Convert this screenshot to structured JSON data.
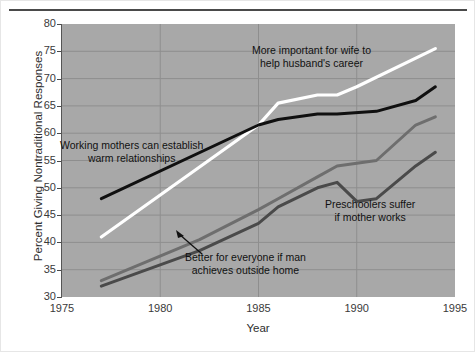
{
  "figure": {
    "background": "#ffffff",
    "plot_background": "#a8a8a8",
    "axis_title_x": "Year",
    "axis_title_y": "Percent Giving Nontraditional Responses"
  },
  "chart_data": {
    "type": "line",
    "title": "",
    "subtitle": "",
    "xlabel": "Year",
    "ylabel": "Percent Giving Nontraditional Responses",
    "xlim": [
      1975,
      1995
    ],
    "ylim": [
      30,
      80
    ],
    "xticks": [
      1975,
      1980,
      1985,
      1990,
      1995
    ],
    "xtick_labels": [
      "1975",
      "1980",
      "1985",
      "1990",
      "1995"
    ],
    "yticks": [
      30,
      35,
      40,
      45,
      50,
      55,
      60,
      65,
      70,
      75,
      80
    ],
    "ytick_labels": [
      "30",
      "35",
      "40",
      "45",
      "50",
      "55",
      "60",
      "65",
      "70",
      "75",
      "80"
    ],
    "grid": true,
    "grid_color": "#8e8e8e",
    "legend_position": "inline-annotations",
    "series": [
      {
        "name": "More important for wife to help husband's career",
        "color": "#ffffff",
        "width": 3.2,
        "x": [
          1977,
          1985,
          1986,
          1988,
          1989,
          1990,
          1994
        ],
        "values": [
          41.0,
          61.5,
          65.5,
          67.0,
          67.0,
          68.5,
          75.5
        ]
      },
      {
        "name": "Working mothers can establish warm relationships",
        "color": "#101010",
        "width": 3.0,
        "x": [
          1977,
          1985,
          1986,
          1988,
          1989,
          1991,
          1993,
          1994
        ],
        "values": [
          48.0,
          61.5,
          62.5,
          63.5,
          63.5,
          64.0,
          66.0,
          68.5
        ]
      },
      {
        "name": "Better for everyone if man achieves outside home",
        "color": "#6e6e6e",
        "width": 3.0,
        "x": [
          1977,
          1982,
          1985,
          1986,
          1988,
          1989,
          1991,
          1993,
          1994
        ],
        "values": [
          33.0,
          40.5,
          46.0,
          48.0,
          52.0,
          54.0,
          55.0,
          61.5,
          63.0
        ]
      },
      {
        "name": "Preschoolers suffer if mother works",
        "color": "#4a4a4a",
        "width": 3.0,
        "x": [
          1977,
          1982,
          1985,
          1986,
          1988,
          1989,
          1990,
          1991,
          1993,
          1994
        ],
        "values": [
          32.0,
          38.5,
          43.5,
          46.5,
          50.0,
          51.0,
          47.5,
          48.0,
          54.0,
          56.5
        ]
      }
    ],
    "annotations": [
      {
        "id": "annot-wife-career",
        "text": "More important for wife to\nhelp husband's career",
        "color": "#111111",
        "x_px": 252,
        "y_px": 44
      },
      {
        "id": "annot-working-mothers",
        "text": "Working mothers can establish\nwarm relationships",
        "color": "#111111",
        "x_px": 60,
        "y_px": 139
      },
      {
        "id": "annot-better-for-everyone",
        "text": "Better for everyone if man\nachieves outside home",
        "color": "#111111",
        "x_px": 185,
        "y_px": 251,
        "has_arrow": true
      },
      {
        "id": "annot-preschoolers",
        "text": "Preschoolers suffer\nif mother works",
        "color": "#111111",
        "x_px": 325,
        "y_px": 198
      }
    ]
  }
}
